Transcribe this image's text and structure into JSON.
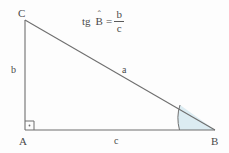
{
  "figure": {
    "background_color": "#fdfdfd",
    "line_color": "#6f6f6f",
    "text_color": "#4a4a4a",
    "angle_fill_color": "#dcecf2",
    "width": 229,
    "height": 153
  },
  "formula": {
    "function_name": "tg",
    "angle_symbol": "B",
    "angle_hat": "ˆ",
    "equals": "=",
    "numerator": "b",
    "denominator": "c"
  },
  "vertices": [
    {
      "label": "C",
      "name": "vertex-c",
      "x": 25,
      "y": 20
    },
    {
      "label": "A",
      "name": "vertex-a",
      "x": 25,
      "y": 130
    },
    {
      "label": "B",
      "name": "vertex-b",
      "x": 215,
      "y": 130
    }
  ],
  "sides": [
    {
      "label": "b",
      "name": "side-b",
      "description": "leg CA (vertical)"
    },
    {
      "label": "a",
      "name": "side-a",
      "description": "hypotenuse CB"
    },
    {
      "label": "c",
      "name": "side-c",
      "description": "leg AB (horizontal)"
    }
  ],
  "markers": {
    "right_angle_vertex": "A",
    "right_angle_symbol": "square-with-dot",
    "marked_angle_vertex": "B"
  }
}
